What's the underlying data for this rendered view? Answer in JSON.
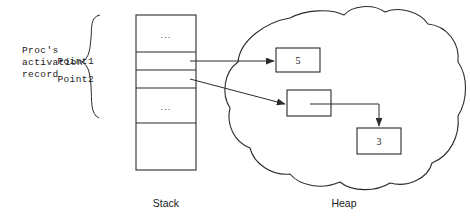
{
  "diagram": {
    "type": "pointer-memory-diagram",
    "annotation": {
      "brace_label_lines": [
        "Proc's",
        "activation",
        "record"
      ]
    },
    "stack": {
      "region_label": "Stack",
      "cells": [
        {
          "name": "upper-ellipsis",
          "text": "...",
          "label": ""
        },
        {
          "name": "pointer-1",
          "text": "",
          "label": "Point1"
        },
        {
          "name": "pointer-2",
          "text": "",
          "label": "Point2"
        },
        {
          "name": "lower-ellipsis",
          "text": "...",
          "label": ""
        },
        {
          "name": "empty-tail",
          "text": "",
          "label": ""
        }
      ]
    },
    "heap": {
      "region_label": "Heap",
      "boxes": [
        {
          "name": "heap-box-five",
          "value": "5"
        },
        {
          "name": "heap-box-pointer",
          "value": ""
        },
        {
          "name": "heap-box-three",
          "value": "3"
        }
      ]
    },
    "edges": [
      {
        "name": "point1-to-five",
        "from": "pointer-1",
        "to": "heap-box-five"
      },
      {
        "name": "point2-to-pointer-box",
        "from": "pointer-2",
        "to": "heap-box-pointer"
      },
      {
        "name": "pointer-box-to-three",
        "from": "heap-box-pointer",
        "to": "heap-box-three"
      }
    ]
  },
  "colors": {
    "ink": "#2b2b2b",
    "paper": "#ffffff"
  }
}
